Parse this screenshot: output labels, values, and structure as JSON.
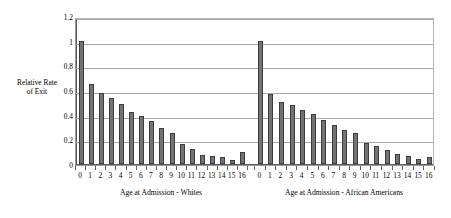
{
  "chart_data": {
    "type": "bar",
    "title": "",
    "subtitle": "",
    "ylabel": "Relative Rate of Exit",
    "xlabel": "",
    "ylim": [
      0,
      1.2
    ],
    "ytick_values": [
      0,
      0.2,
      0.4,
      0.6,
      0.8,
      1,
      1.2
    ],
    "ytick_labels": [
      "0",
      "0.2",
      "0.4",
      "0.6",
      "0.8",
      "1",
      "1.2"
    ],
    "grid": "horizontal",
    "legend": "none",
    "categories": [
      "0",
      "1",
      "2",
      "3",
      "4",
      "5",
      "6",
      "7",
      "8",
      "9",
      "10",
      "11",
      "12",
      "13",
      "14",
      "15",
      "16"
    ],
    "panels": [
      {
        "name": "whites",
        "caption": "Age at Admission - Whites",
        "values": [
          1.0,
          0.65,
          0.575,
          0.535,
          0.49,
          0.425,
          0.39,
          0.35,
          0.29,
          0.255,
          0.16,
          0.12,
          0.075,
          0.065,
          0.06,
          0.03,
          0.1
        ]
      },
      {
        "name": "african_americans",
        "caption": "Age at Admission - African Americans",
        "values": [
          1.0,
          0.57,
          0.5,
          0.475,
          0.435,
          0.405,
          0.36,
          0.32,
          0.275,
          0.25,
          0.17,
          0.145,
          0.11,
          0.08,
          0.065,
          0.04,
          0.055
        ]
      }
    ],
    "colors": {
      "bar_fill": "#737373",
      "bar_edge": "#3d3d3d",
      "gridline": "#a8a8a8",
      "axis": "#5a5a5a",
      "background": "#ffffff",
      "text": "#000000"
    }
  },
  "axis": {
    "y_title_line1": "Relative Rate",
    "y_title_line2": "of Exit"
  }
}
